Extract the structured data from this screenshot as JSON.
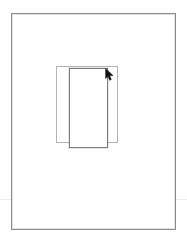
{
  "screen": {
    "width": 187,
    "height": 242,
    "background_color": "#fdfdfd",
    "title": "Canvas"
  },
  "canvas": {
    "name": "drawing-canvas",
    "background_color": "#fefefe",
    "fill_color": "#ffffff"
  },
  "hairline": {
    "label": "horizontal guide line",
    "color": "#ededed",
    "x": 0,
    "y": 199,
    "width": 187,
    "height": 1
  },
  "document_frame": {
    "label": "page outline",
    "border_color": "#8c8c8c",
    "fill_color": "#ffffff",
    "x": 11,
    "y": 13,
    "width": 165,
    "height": 217
  },
  "shapes": [
    {
      "id": "rect-back",
      "label": "Rectangle 1",
      "state": "unselected",
      "border_color": "#b4b4b4",
      "fill_color": "#ffffff",
      "x": 56,
      "y": 66,
      "width": 62,
      "height": 77
    },
    {
      "id": "rect-front",
      "label": "Rectangle 2",
      "state": "selected",
      "border_color": "#7c7c7c",
      "fill_color": "#ffffff",
      "x": 69,
      "y": 68,
      "width": 39,
      "height": 80
    }
  ],
  "cursor": {
    "icon": "arrow-pointer-icon",
    "color": "#111111",
    "x": 105,
    "y": 68
  }
}
